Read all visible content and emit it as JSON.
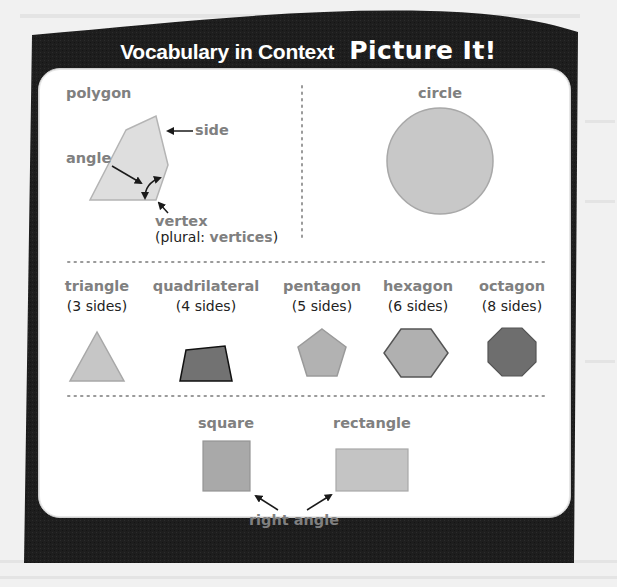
{
  "header": {
    "title": "Vocabulary in Context",
    "subtitle": "Picture It!"
  },
  "colors": {
    "frame": "#1f1f1f",
    "panel": "#ffffff",
    "label": "#808080",
    "shape_light": "#c4c4c4",
    "shape_mid": "#a9a9a9",
    "shape_dark": "#6f6f6f",
    "divider": "#9a9a9a"
  },
  "polygon_section": {
    "heading": "polygon",
    "labels": {
      "side": "side",
      "angle": "angle",
      "vertex": "vertex",
      "plural_prefix": "(plural: ",
      "plural_word": "vertices",
      "plural_suffix": ")"
    }
  },
  "circle_section": {
    "heading": "circle"
  },
  "shapes_row": [
    {
      "name": "triangle",
      "sides": "(3 sides)"
    },
    {
      "name": "quadrilateral",
      "sides": "(4 sides)"
    },
    {
      "name": "pentagon",
      "sides": "(5 sides)"
    },
    {
      "name": "hexagon",
      "sides": "(6 sides)"
    },
    {
      "name": "octagon",
      "sides": "(8 sides)"
    }
  ],
  "right_angle_section": {
    "square": "square",
    "rectangle": "rectangle",
    "caption": "right angle"
  }
}
